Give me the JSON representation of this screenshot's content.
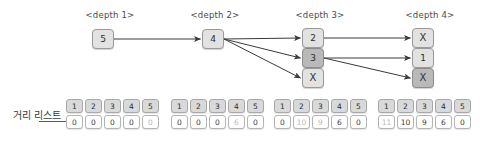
{
  "diagram": {
    "title_visible": false,
    "colors": {
      "node_light": "#e2e2e2",
      "node_dark": "#b9b9b9",
      "node_border": "#9a9a9a",
      "edge": "#3a3a3a",
      "header_cell": "#d9d9d9",
      "value_cell": "#ffffff",
      "faded_text": "#b8b8b8",
      "text": "#3a3a3a"
    },
    "depth_labels": [
      {
        "text": "<depth 1>",
        "x": 110,
        "y": 10
      },
      {
        "text": "<depth 2>",
        "x": 215,
        "y": 10
      },
      {
        "text": "<depth 3>",
        "x": 320,
        "y": 10
      },
      {
        "text": "<depth 4>",
        "x": 430,
        "y": 10
      }
    ],
    "nodes": [
      {
        "id": "d1n1",
        "label": "5",
        "depth": 1,
        "x": 92,
        "y": 29,
        "shade": "light",
        "kind": "value"
      },
      {
        "id": "d2n1",
        "label": "4",
        "depth": 2,
        "x": 202,
        "y": 29,
        "shade": "light",
        "kind": "value"
      },
      {
        "id": "d3n1",
        "label": "2",
        "depth": 3,
        "x": 302,
        "y": 28,
        "shade": "light",
        "kind": "value"
      },
      {
        "id": "d3n2",
        "label": "3",
        "depth": 3,
        "x": 302,
        "y": 48,
        "shade": "dark",
        "kind": "value"
      },
      {
        "id": "d3n3",
        "label": "X",
        "depth": 3,
        "x": 302,
        "y": 68,
        "shade": "light",
        "kind": "x"
      },
      {
        "id": "d4n1",
        "label": "X",
        "depth": 4,
        "x": 412,
        "y": 28,
        "shade": "light",
        "kind": "x"
      },
      {
        "id": "d4n2",
        "label": "1",
        "depth": 4,
        "x": 412,
        "y": 48,
        "shade": "light",
        "kind": "value"
      },
      {
        "id": "d4n3",
        "label": "X",
        "depth": 4,
        "x": 412,
        "y": 68,
        "shade": "dark",
        "kind": "x"
      }
    ],
    "edges": [
      {
        "from": "d1n1",
        "to": "d2n1"
      },
      {
        "from": "d2n1",
        "to": "d3n1"
      },
      {
        "from": "d2n1",
        "to": "d3n2"
      },
      {
        "from": "d2n1",
        "to": "d3n3"
      },
      {
        "from": "d3n1",
        "to": "d4n1"
      },
      {
        "from": "d3n2",
        "to": "d4n2"
      },
      {
        "from": "d3n2",
        "to": "d4n3"
      }
    ]
  },
  "distance_list": {
    "label": "거리 리스트",
    "label_x": 13,
    "label_y": 107,
    "tables": [
      {
        "id": "dl-depth-1",
        "x": 66,
        "y": 99,
        "headers": [
          "1",
          "2",
          "3",
          "4",
          "5"
        ],
        "values": [
          "0",
          "0",
          "0",
          "0",
          "0"
        ],
        "faded": [
          false,
          false,
          false,
          false,
          true
        ]
      },
      {
        "id": "dl-depth-2",
        "x": 171,
        "y": 99,
        "headers": [
          "1",
          "2",
          "3",
          "4",
          "5"
        ],
        "values": [
          "0",
          "0",
          "0",
          "6",
          "0"
        ],
        "faded": [
          false,
          false,
          false,
          true,
          false
        ]
      },
      {
        "id": "dl-depth-3",
        "x": 274,
        "y": 99,
        "headers": [
          "1",
          "2",
          "3",
          "4",
          "5"
        ],
        "values": [
          "0",
          "10",
          "9",
          "6",
          "0"
        ],
        "faded": [
          false,
          true,
          true,
          false,
          false
        ]
      },
      {
        "id": "dl-depth-4",
        "x": 378,
        "y": 99,
        "headers": [
          "1",
          "2",
          "3",
          "4",
          "5"
        ],
        "values": [
          "11",
          "10",
          "9",
          "6",
          "0"
        ],
        "faded": [
          true,
          false,
          false,
          false,
          false
        ]
      }
    ]
  }
}
